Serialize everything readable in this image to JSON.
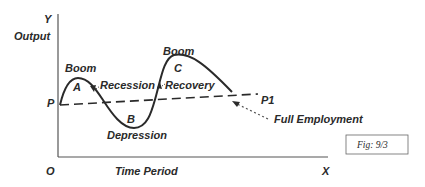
{
  "diagram": {
    "axes": {
      "y_letter": "Y",
      "y_label": "Output",
      "x_letter": "X",
      "x_label": "Time Period",
      "origin": "O"
    },
    "trend_line": {
      "start_label": "P",
      "end_label": "P1",
      "annotation": "Full Employment",
      "style": "dashed"
    },
    "phases": {
      "boom_1": "Boom",
      "point_a": "A",
      "recession": "Recession",
      "point_b": "B",
      "depression": "Depression",
      "recovery": "Recovery",
      "boom_2": "Boom",
      "point_c": "C"
    },
    "figure_label": "Fig: 9/3",
    "colors": {
      "line": "#2a2a2a",
      "background": "#ffffff",
      "axis": "#555555"
    }
  }
}
